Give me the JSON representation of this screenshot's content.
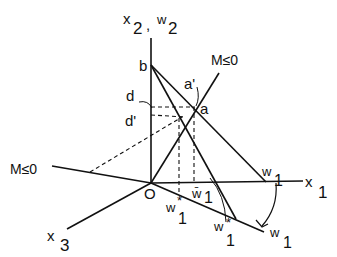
{
  "diagram": {
    "type": "geometric-construction",
    "axes": {
      "vertical": {
        "label_main": "x",
        "label_main_sub": "2",
        "sep": ",",
        "label_alt": "w",
        "label_alt_sub": "2"
      },
      "horizontal": {
        "label": "x",
        "sub": "1"
      },
      "depth": {
        "label": "x",
        "sub": "3"
      }
    },
    "origin": {
      "label": "O"
    },
    "points": {
      "a": "a",
      "a_prime": "a'",
      "b": "b",
      "d": "d",
      "d_prime": "d'"
    },
    "lines": {
      "m_upper": "M≤0",
      "m_left": "M≤0"
    },
    "w_labels": {
      "w1_on_x1": {
        "label": "w",
        "sub": "1"
      },
      "w1_bar": {
        "label": "w̄",
        "sub": "1"
      },
      "w1_star_left": {
        "label": "w",
        "sup": "*",
        "sub": "1"
      },
      "w1_star_right": {
        "label": "w",
        "sup": "*",
        "sub": "1"
      },
      "w1_rotated": {
        "label": "w",
        "sub": "1"
      }
    },
    "colors": {
      "ink": "#111111",
      "background": "#ffffff"
    }
  }
}
